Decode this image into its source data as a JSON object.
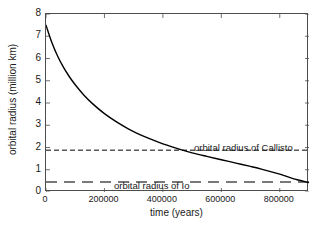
{
  "chart_data": {
    "type": "line",
    "title": "",
    "xlabel": "time (years)",
    "ylabel": "orbital radius (million km)",
    "xlim": [
      0,
      900000
    ],
    "ylim": [
      0,
      8
    ],
    "xticks": [
      0,
      200000,
      400000,
      600000,
      800000
    ],
    "xtick_labels": [
      "0",
      "200000",
      "400000",
      "600000",
      "800000"
    ],
    "yticks": [
      0,
      1,
      2,
      3,
      4,
      5,
      6,
      7,
      8
    ],
    "ytick_labels": [
      "0",
      "1",
      "2",
      "3",
      "4",
      "5",
      "6",
      "7",
      "8"
    ],
    "grid": false,
    "legend": "none",
    "series": [
      {
        "name": "orbital radius",
        "style": "solid",
        "color": "#000000",
        "x": [
          0,
          20000,
          40000,
          60000,
          80000,
          100000,
          130000,
          160000,
          200000,
          240000,
          280000,
          310000,
          350000,
          400000,
          450000,
          500000,
          550000,
          600000,
          650000,
          700000,
          740000,
          800000,
          860000,
          900000
        ],
        "y": [
          7.5,
          6.72,
          6.1,
          5.6,
          5.18,
          4.82,
          4.35,
          3.96,
          3.52,
          3.16,
          2.85,
          2.65,
          2.42,
          2.16,
          1.95,
          1.76,
          1.6,
          1.45,
          1.3,
          1.15,
          1.02,
          0.8,
          0.55,
          0.42
        ]
      }
    ],
    "reference_lines": [
      {
        "name": "orbital radius of Callisto",
        "label": "orbital radius of Callisto",
        "value": 1.88,
        "style": "dashed",
        "color": "#000000",
        "label_x": 310000,
        "label_y": 2.18
      },
      {
        "name": "orbital radius of Io",
        "label": "orbital radius of Io",
        "value": 0.45,
        "style": "long-dashed",
        "color": "#4d4d4d",
        "label_x": 100000,
        "label_y": 0.75
      }
    ]
  },
  "axes": {
    "x_title": "time (years)",
    "y_title": "orbital radius (million km)"
  },
  "annotations": {
    "callisto": "orbital radius of Callisto",
    "io": "orbital radius of Io"
  }
}
